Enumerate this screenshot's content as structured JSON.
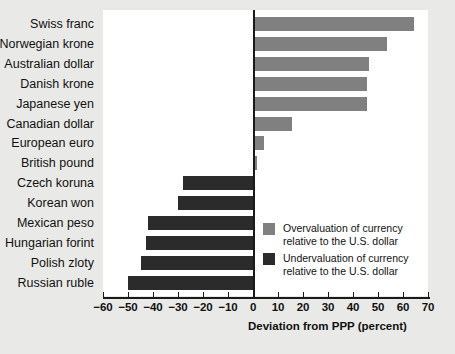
{
  "chart_data": {
    "type": "bar",
    "orientation": "horizontal",
    "title": "",
    "xlabel": "Deviation from PPP (percent)",
    "ylabel": "",
    "xlim": [
      -60,
      70
    ],
    "xticks": [
      -60,
      -50,
      -40,
      -30,
      -20,
      -10,
      0,
      10,
      20,
      30,
      40,
      50,
      60,
      70
    ],
    "xticklabels": [
      "−60",
      "−50",
      "−40",
      "−30",
      "−20",
      "−10",
      "0",
      "10",
      "20",
      "30",
      "40",
      "50",
      "60",
      "70"
    ],
    "grid": false,
    "categories": [
      "Swiss franc",
      "Norwegian krone",
      "Australian dollar",
      "Danish krone",
      "Japanese yen",
      "Canadian dollar",
      "European euro",
      "British pound",
      "Czech koruna",
      "Korean won",
      "Mexican peso",
      "Hungarian forint",
      "Polish zloty",
      "Russian ruble"
    ],
    "values": [
      64,
      53,
      46,
      45,
      45,
      15,
      4,
      1,
      -28,
      -30,
      -42,
      -43,
      -45,
      -50
    ],
    "colors": {
      "overvaluation": "#808080",
      "undervaluation": "#2b2b2b",
      "plot_background": "#ffffff",
      "figure_background": "#e9e9e7",
      "axis": "#1a1a1a"
    },
    "legend": {
      "position": "inside-lower-right",
      "entries": [
        {
          "swatch": "overvaluation",
          "line1": "Overvaluation of currency",
          "line2": "relative to the U.S. dollar"
        },
        {
          "swatch": "undervaluation",
          "line1": "Undervaluation of currency",
          "line2": "relative to the U.S. dollar"
        }
      ]
    }
  }
}
